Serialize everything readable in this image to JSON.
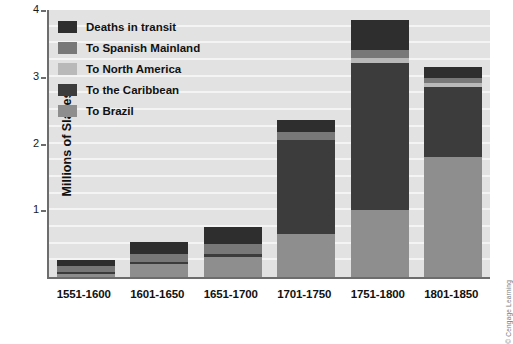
{
  "chart_data": {
    "type": "bar",
    "subtype": "stacked-bar",
    "title": "",
    "xlabel": "",
    "ylabel": "Millions of Slaves",
    "ylim": [
      0,
      4
    ],
    "yticks": [
      1,
      2,
      3,
      4
    ],
    "ytick_labels": [
      "1",
      "2",
      "3",
      "4"
    ],
    "grid": true,
    "grid_axis": "y",
    "legend_position": "upper-left",
    "units": "millions of slaves",
    "categories": [
      "1551-1600",
      "1601-1650",
      "1651-1700",
      "1701-1750",
      "1751-1800",
      "1801-1850"
    ],
    "series": [
      {
        "name": "To Brazil",
        "color": "#8e8e8e",
        "values": [
          0.05,
          0.2,
          0.3,
          0.65,
          1.0,
          1.8
        ]
      },
      {
        "name": "To the Caribbean",
        "color": "#3c3c3c",
        "values": [
          0.02,
          0.03,
          0.05,
          1.4,
          2.2,
          1.05
        ]
      },
      {
        "name": "To North America",
        "color": "#b9b9b9",
        "values": [
          0.0,
          0.0,
          0.0,
          0.0,
          0.08,
          0.05
        ]
      },
      {
        "name": "To Spanish Mainland",
        "color": "#787878",
        "values": [
          0.1,
          0.12,
          0.14,
          0.12,
          0.12,
          0.08
        ]
      },
      {
        "name": "Deaths in transit",
        "color": "#2e2e2e",
        "values": [
          0.08,
          0.17,
          0.26,
          0.18,
          0.45,
          0.17
        ]
      }
    ],
    "totals": [
      0.25,
      0.52,
      0.75,
      2.35,
      3.85,
      3.15
    ],
    "stack_order_bottom_to_top": [
      "To Brazil",
      "To the Caribbean",
      "To North America",
      "To Spanish Mainland",
      "Deaths in transit"
    ]
  },
  "legend": {
    "items": [
      {
        "label": "Deaths in transit",
        "color": "#2e2e2e"
      },
      {
        "label": "To Spanish Mainland",
        "color": "#787878"
      },
      {
        "label": "To North America",
        "color": "#b9b9b9"
      },
      {
        "label": "To the Caribbean",
        "color": "#3c3c3c"
      },
      {
        "label": "To Brazil",
        "color": "#8e8e8e"
      }
    ]
  },
  "credit": "© Cengage Learning",
  "colors": {
    "plot_background": "#e2e2e2",
    "gridline": "#f4f4f4",
    "axis": "#6d6d6d",
    "page_background": "#ffffff",
    "text": "#111111"
  }
}
